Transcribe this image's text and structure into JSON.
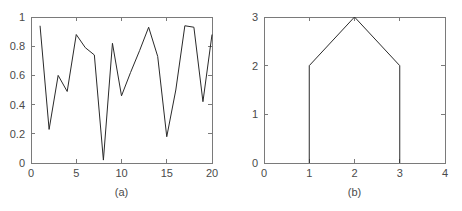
{
  "figure": {
    "panels": [
      {
        "id": "a",
        "caption": "(a)",
        "chart_index": 0
      },
      {
        "id": "b",
        "caption": "(b)",
        "chart_index": 1
      }
    ],
    "colors": {
      "background": "#ffffff",
      "axis": "#7a7a7a",
      "data_line": "#2a2a2a",
      "text": "#4a4a4a"
    }
  },
  "chart_data": [
    {
      "type": "line",
      "title": "",
      "subtitle": "",
      "caption": "(a)",
      "xlabel": "",
      "ylabel": "",
      "xlim": [
        0,
        20
      ],
      "ylim": [
        0,
        1
      ],
      "grid": false,
      "legend": null,
      "xticks": [
        0,
        5,
        10,
        15,
        20
      ],
      "xticklabels": [
        "0",
        "5",
        "10",
        "15",
        "20"
      ],
      "yticks": [
        0,
        0.2,
        0.4,
        0.6,
        0.8,
        1
      ],
      "yticklabels": [
        "0",
        "0.2",
        "0.4",
        "0.6",
        "0.8",
        "1"
      ],
      "x": [
        1,
        2,
        3,
        4,
        5,
        6,
        7,
        8,
        9,
        10,
        11,
        12,
        13,
        14,
        15,
        16,
        17,
        18,
        19,
        20
      ],
      "values": [
        0.94,
        0.23,
        0.6,
        0.49,
        0.88,
        0.79,
        0.74,
        0.02,
        0.82,
        0.46,
        0.62,
        0.77,
        0.93,
        0.73,
        0.18,
        0.5,
        0.94,
        0.93,
        0.42,
        0.88
      ]
    },
    {
      "type": "line",
      "title": "",
      "subtitle": "",
      "caption": "(b)",
      "xlabel": "",
      "ylabel": "",
      "xlim": [
        0,
        4
      ],
      "ylim": [
        0,
        3
      ],
      "grid": false,
      "legend": null,
      "xticks": [
        0,
        1,
        2,
        3,
        4
      ],
      "xticklabels": [
        "0",
        "1",
        "2",
        "3",
        "4"
      ],
      "yticks": [
        0,
        1,
        2,
        3
      ],
      "yticklabels": [
        "0",
        "1",
        "2",
        "3"
      ],
      "x": [
        1,
        1,
        2,
        3,
        3
      ],
      "values": [
        0,
        2,
        3,
        2,
        0
      ]
    }
  ]
}
